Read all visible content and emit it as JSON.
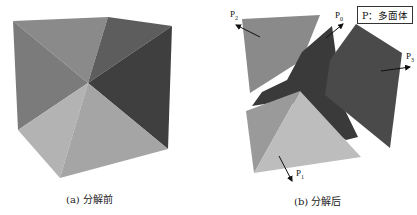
{
  "figure": {
    "left": {
      "caption": "(a) 分解前",
      "description": "cube before decomposition"
    },
    "right": {
      "caption": "(b) 分解后",
      "description": "cube decomposed into polyhedra P0-P3",
      "labels": {
        "p0": {
          "main": "P",
          "sub": "0"
        },
        "p1": {
          "main": "P",
          "sub": "1"
        },
        "p2": {
          "main": "P",
          "sub": "2"
        },
        "p3": {
          "main": "P",
          "sub": "3"
        }
      },
      "legend": "P：多面体"
    },
    "colors": {
      "face_light": "#b3b3b3",
      "face_lightmid": "#a5a5a5",
      "face_mid": "#8a8a8a",
      "face_midleft": "#7b7b7b",
      "face_darkmid": "#5d5d5d",
      "face_dark": "#3f3f3f",
      "face_darkest": "#353535"
    }
  }
}
